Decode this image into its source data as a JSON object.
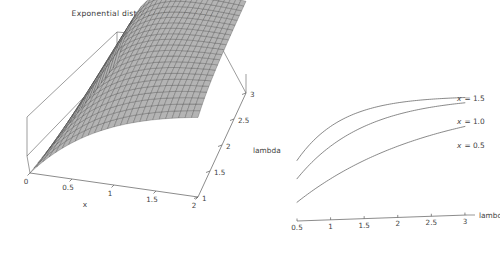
{
  "figure": {
    "title": "Exponential distribution: cumulative",
    "background": "#ffffff",
    "width": 500,
    "height": 263
  },
  "chart_data": [
    {
      "id": "surface-3d",
      "type": "surface",
      "title": "Exponential distribution: cumulative",
      "function": "1 - Exp(-lambda * x)",
      "xlabel": "x",
      "ylabel": "lambda",
      "zlabel": "",
      "xlim": [
        0,
        2
      ],
      "ylim": [
        1,
        3
      ],
      "zlim": [
        0,
        1
      ],
      "xticks": [
        "0",
        "0.5",
        "1",
        "1.5",
        "2"
      ],
      "xtick_values": [
        0,
        0.5,
        1,
        1.5,
        2
      ],
      "yticks": [
        "1",
        "1.5",
        "2",
        "2.5",
        "3"
      ],
      "ytick_values": [
        1,
        1.5,
        2,
        2.5,
        3
      ],
      "grid": true,
      "mesh_divisions_x": 26,
      "mesh_divisions_y": 22,
      "surface_fill": "#b4b4b4",
      "mesh_color": "#3c3c3c",
      "box_color": "#5a5a5a",
      "legend": "none"
    },
    {
      "id": "cdf-curves-2d",
      "type": "line",
      "title": "",
      "xlabel": "lambda",
      "ylabel": "",
      "xlim": [
        0.5,
        3.15
      ],
      "ylim": [
        0,
        1
      ],
      "xticks": [
        "0.5",
        "1",
        "1.5",
        "2",
        "2.5",
        "3"
      ],
      "xtick_values": [
        0.5,
        1,
        1.5,
        2,
        2.5,
        3
      ],
      "grid": false,
      "legend_position": "right-inline",
      "series": [
        {
          "name": "x = 1.5",
          "label_var": "x",
          "label_eq": "= 1.5",
          "x_param": 1.5,
          "x": [
            0.5,
            0.75,
            1.0,
            1.25,
            1.5,
            1.75,
            2.0,
            2.25,
            2.5,
            2.75,
            3.0
          ],
          "values": [
            0.528,
            0.675,
            0.777,
            0.847,
            0.895,
            0.928,
            0.95,
            0.966,
            0.976,
            0.984,
            0.989
          ]
        },
        {
          "name": "x = 1.0",
          "label_var": "x",
          "label_eq": "= 1.0",
          "x_param": 1.0,
          "x": [
            0.5,
            0.75,
            1.0,
            1.25,
            1.5,
            1.75,
            2.0,
            2.25,
            2.5,
            2.75,
            3.0
          ],
          "values": [
            0.393,
            0.528,
            0.632,
            0.713,
            0.777,
            0.826,
            0.865,
            0.895,
            0.918,
            0.936,
            0.95
          ]
        },
        {
          "name": "x = 0.5",
          "label_var": "x",
          "label_eq": "= 0.5",
          "x_param": 0.5,
          "x": [
            0.5,
            0.75,
            1.0,
            1.25,
            1.5,
            1.75,
            2.0,
            2.25,
            2.5,
            2.75,
            3.0
          ],
          "values": [
            0.221,
            0.313,
            0.393,
            0.465,
            0.528,
            0.583,
            0.632,
            0.675,
            0.713,
            0.747,
            0.777
          ]
        }
      ],
      "curve_color": "#6b6b6b",
      "axis_color": "#5a5a5a"
    }
  ]
}
